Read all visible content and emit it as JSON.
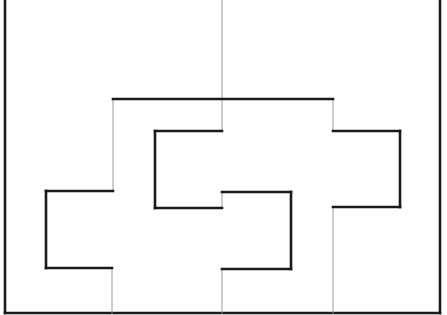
{
  "diagram": {
    "width": 447,
    "height": 315,
    "colors": {
      "background": "#ffffff",
      "thick_line": "#1a1a1a",
      "thin_line": "#9a9a9a"
    },
    "stroke": {
      "thick": 2.6,
      "thin": 1
    },
    "outer_frame": {
      "left_x": 5,
      "right_x": 440,
      "bottom_y": 313,
      "top_y": 0
    },
    "thick_segments": [
      [
        [
          113,
          99
        ],
        [
          333,
          99
        ]
      ],
      [
        [
          333,
          131
        ],
        [
          400,
          131
        ]
      ],
      [
        [
          400,
          131
        ],
        [
          400,
          207
        ]
      ],
      [
        [
          400,
          207
        ],
        [
          333,
          207
        ]
      ],
      [
        [
          113,
          191
        ],
        [
          46,
          191
        ]
      ],
      [
        [
          46,
          191
        ],
        [
          46,
          268
        ]
      ],
      [
        [
          46,
          268
        ],
        [
          112,
          268
        ]
      ],
      [
        [
          222,
          131
        ],
        [
          155,
          131
        ]
      ],
      [
        [
          155,
          131
        ],
        [
          155,
          208
        ]
      ],
      [
        [
          155,
          208
        ],
        [
          222,
          208
        ]
      ],
      [
        [
          222,
          192
        ],
        [
          291,
          192
        ]
      ],
      [
        [
          291,
          192
        ],
        [
          291,
          269
        ]
      ],
      [
        [
          291,
          269
        ],
        [
          222,
          269
        ]
      ]
    ],
    "thin_segments": [
      [
        [
          222,
          0
        ],
        [
          222,
          131
        ]
      ],
      [
        [
          113,
          99
        ],
        [
          113,
          191
        ]
      ],
      [
        [
          333,
          99
        ],
        [
          333,
          131
        ]
      ],
      [
        [
          222,
          208
        ],
        [
          222,
          192
        ]
      ],
      [
        [
          112,
          268
        ],
        [
          112,
          313
        ]
      ],
      [
        [
          222,
          269
        ],
        [
          222,
          313
        ]
      ],
      [
        [
          333,
          207
        ],
        [
          333,
          313
        ]
      ]
    ]
  }
}
